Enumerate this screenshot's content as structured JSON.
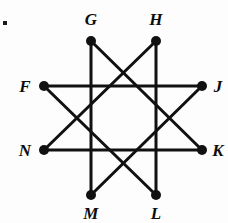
{
  "figure": {
    "type": "star-polygon-diagram",
    "corner_mark": {
      "name": "bullet-mark",
      "x": 3,
      "y": 21,
      "size": 4
    },
    "style": {
      "stroke_color": "#111111",
      "stroke_width": 3.0,
      "vertex_color": "#111111",
      "vertex_radius": 5.0,
      "background": "#fdfdfd",
      "label_color": "#0d0d0d",
      "label_font_size": 17
    },
    "vertices": [
      {
        "id": "G",
        "label": "G",
        "x": 91,
        "y": 41,
        "label_x": 91,
        "label_y": 19
      },
      {
        "id": "H",
        "label": "H",
        "x": 156,
        "y": 41,
        "label_x": 156,
        "label_y": 19
      },
      {
        "id": "J",
        "label": "J",
        "x": 202,
        "y": 86,
        "label_x": 218,
        "label_y": 86
      },
      {
        "id": "K",
        "label": "K",
        "x": 202,
        "y": 150,
        "label_x": 218,
        "label_y": 150
      },
      {
        "id": "L",
        "label": "L",
        "x": 156,
        "y": 195,
        "label_x": 156,
        "label_y": 213
      },
      {
        "id": "M",
        "label": "M",
        "x": 91,
        "y": 195,
        "label_x": 91,
        "label_y": 213
      },
      {
        "id": "N",
        "label": "N",
        "x": 44,
        "y": 150,
        "label_x": 25,
        "label_y": 150
      },
      {
        "id": "F",
        "label": "F",
        "x": 44,
        "y": 86,
        "label_x": 25,
        "label_y": 86
      }
    ],
    "edges": [
      {
        "id": "GM",
        "from": "G",
        "to": "M",
        "x1": 91,
        "y1": 41,
        "x2": 91,
        "y2": 195
      },
      {
        "id": "GK",
        "from": "G",
        "to": "K",
        "x1": 91,
        "y1": 41,
        "x2": 202,
        "y2": 150
      },
      {
        "id": "HL",
        "from": "H",
        "to": "L",
        "x1": 156,
        "y1": 41,
        "x2": 156,
        "y2": 195
      },
      {
        "id": "HN",
        "from": "H",
        "to": "N",
        "x1": 156,
        "y1": 41,
        "x2": 44,
        "y2": 150
      },
      {
        "id": "FJ",
        "from": "F",
        "to": "J",
        "x1": 44,
        "y1": 86,
        "x2": 202,
        "y2": 86
      },
      {
        "id": "FL",
        "from": "F",
        "to": "L",
        "x1": 44,
        "y1": 86,
        "x2": 156,
        "y2": 195
      },
      {
        "id": "NK",
        "from": "N",
        "to": "K",
        "x1": 44,
        "y1": 150,
        "x2": 202,
        "y2": 150
      },
      {
        "id": "JM",
        "from": "J",
        "to": "M",
        "x1": 202,
        "y1": 86,
        "x2": 91,
        "y2": 195
      }
    ]
  }
}
